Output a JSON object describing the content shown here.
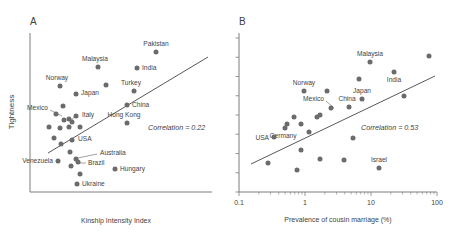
{
  "figure": {
    "background_color": "#ffffff",
    "dot_color": "#6b6b6b",
    "line_color": "#595959",
    "axis_color": "#7d7d7d",
    "text_color": "#3f3f3f"
  },
  "panels": [
    {
      "letter": "A",
      "ylabel": "Tightness",
      "xlabel": "Kinship Intensity Index",
      "correlation_text": "Correlation = 0.22"
    },
    {
      "letter": "B",
      "ylabel": "",
      "xlabel": "Prevalence of cousin marriage (%)",
      "correlation_text": "Correlation = 0.53",
      "xticks": [
        "0.1",
        "1",
        "10",
        "100"
      ]
    }
  ],
  "chart_data": [
    {
      "type": "scatter",
      "title": "A",
      "xlabel": "Kinship Intensity Index",
      "ylabel": "Tightness",
      "correlation": 0.22,
      "annotation": "Correlation = 0.22",
      "xaxis_scale": "linear",
      "xaxis_ticks": [],
      "yaxis_ticks": [],
      "grid": false,
      "trend_line": {
        "x1": 48,
        "y1": 153,
        "x2": 208,
        "y2": 57
      },
      "points": [
        {
          "label": "Malaysia",
          "x": 98,
          "y": 67,
          "label_dx": -3,
          "label_dy": -6,
          "anchor": "middle"
        },
        {
          "label": "Pakistan",
          "x": 156,
          "y": 52,
          "label_dx": 0,
          "label_dy": -6,
          "anchor": "middle"
        },
        {
          "label": "India",
          "x": 137,
          "y": 68,
          "label_dx": 5,
          "label_dy": 2,
          "anchor": "start"
        },
        {
          "label": "Norway",
          "x": 60,
          "y": 86,
          "label_dx": -3,
          "label_dy": -6,
          "anchor": "middle"
        },
        {
          "label": "Turkey",
          "x": 134,
          "y": 91,
          "label_dx": -3,
          "label_dy": -6,
          "anchor": "middle"
        },
        {
          "label": "Japan",
          "x": 76,
          "y": 94,
          "label_dx": 5,
          "label_dy": 1,
          "anchor": "start"
        },
        {
          "label": "China",
          "x": 127,
          "y": 105,
          "label_dx": 5,
          "label_dy": 2,
          "anchor": "start"
        },
        {
          "label": "Italy",
          "x": 76,
          "y": 116,
          "label_dx": 6,
          "label_dy": 1,
          "anchor": "start"
        },
        {
          "label": "Hong Kong",
          "x": 127,
          "y": 123,
          "label_dx": -3,
          "label_dy": -6,
          "anchor": "middle"
        },
        {
          "label": "USA",
          "x": 72,
          "y": 140,
          "label_dx": 6,
          "label_dy": 1,
          "anchor": "start"
        },
        {
          "label": "Venezuela",
          "x": 58,
          "y": 161,
          "label_dx": -5,
          "label_dy": 2,
          "anchor": "end"
        },
        {
          "label": "Hungary",
          "x": 115,
          "y": 169,
          "label_dx": 5,
          "label_dy": 2,
          "anchor": "start"
        },
        {
          "label": "Ukraine",
          "x": 77,
          "y": 184,
          "label_dx": 5,
          "label_dy": 2,
          "anchor": "start"
        },
        {
          "label": "",
          "x": 106,
          "y": 85,
          "label_dx": 0,
          "label_dy": 0,
          "anchor": "middle"
        },
        {
          "label": "",
          "x": 63,
          "y": 106,
          "label_dx": 0,
          "label_dy": 0,
          "anchor": "middle"
        },
        {
          "label": "",
          "x": 56,
          "y": 114,
          "label_dx": 0,
          "label_dy": 0,
          "anchor": "middle"
        },
        {
          "label": "",
          "x": 64,
          "y": 120,
          "label_dx": 0,
          "label_dy": 0,
          "anchor": "middle"
        },
        {
          "label": "",
          "x": 69,
          "y": 119,
          "label_dx": 0,
          "label_dy": 0,
          "anchor": "middle"
        },
        {
          "label": "",
          "x": 72,
          "y": 122,
          "label_dx": 0,
          "label_dy": 0,
          "anchor": "middle"
        },
        {
          "label": "",
          "x": 69,
          "y": 127,
          "label_dx": 0,
          "label_dy": 0,
          "anchor": "middle"
        },
        {
          "label": "",
          "x": 49,
          "y": 127,
          "label_dx": 0,
          "label_dy": 0,
          "anchor": "middle"
        },
        {
          "label": "",
          "x": 60,
          "y": 128,
          "label_dx": 0,
          "label_dy": 0,
          "anchor": "middle"
        },
        {
          "label": "",
          "x": 80,
          "y": 127,
          "label_dx": 0,
          "label_dy": 0,
          "anchor": "middle"
        },
        {
          "label": "",
          "x": 54,
          "y": 138,
          "label_dx": 0,
          "label_dy": 0,
          "anchor": "middle"
        },
        {
          "label": "",
          "x": 61,
          "y": 144,
          "label_dx": 0,
          "label_dy": 0,
          "anchor": "middle"
        },
        {
          "label": "",
          "x": 70,
          "y": 152,
          "label_dx": 0,
          "label_dy": 0,
          "anchor": "middle"
        },
        {
          "label": "",
          "x": 76,
          "y": 159,
          "label_dx": 0,
          "label_dy": 0,
          "anchor": "middle"
        },
        {
          "label": "",
          "x": 78,
          "y": 162,
          "label_dx": 0,
          "label_dy": 0,
          "anchor": "middle"
        },
        {
          "label": "",
          "x": 71,
          "y": 166,
          "label_dx": 0,
          "label_dy": 0,
          "anchor": "middle"
        },
        {
          "label": "",
          "x": 80,
          "y": 174,
          "label_dx": 0,
          "label_dy": 0,
          "anchor": "middle"
        }
      ],
      "leader_lines": [
        {
          "name": "mexico-leader",
          "x1": 50,
          "y1": 110,
          "x2": 62,
          "y2": 116
        },
        {
          "name": "italy-leader",
          "x1": 75,
          "y1": 116,
          "x2": 70,
          "y2": 122
        },
        {
          "name": "australia-leader",
          "x1": 97,
          "y1": 154,
          "x2": 78,
          "y2": 158
        },
        {
          "name": "brazil-leader",
          "x1": 86,
          "y1": 163,
          "x2": 79,
          "y2": 163
        }
      ],
      "callout_labels": [
        {
          "text": "Mexico",
          "x": 48,
          "y": 110,
          "anchor": "end"
        },
        {
          "text": "Australia",
          "x": 100,
          "y": 155,
          "anchor": "start"
        },
        {
          "text": "Brazil",
          "x": 88,
          "y": 165,
          "anchor": "start"
        }
      ]
    },
    {
      "type": "scatter",
      "title": "B",
      "xlabel": "Prevalence of cousin marriage (%)",
      "ylabel": "",
      "correlation": 0.53,
      "annotation": "Correlation = 0.53",
      "xaxis_scale": "log",
      "xaxis_ticks": [
        "0.1",
        "1",
        "10",
        "100"
      ],
      "xlim": [
        0.1,
        100
      ],
      "grid": false,
      "trend_line": {
        "x1": 12,
        "y1": 164,
        "x2": 196,
        "y2": 76
      },
      "points": [
        {
          "label": "Malaysia",
          "x": 131,
          "y": 62,
          "label_dx": 0,
          "label_dy": -6,
          "anchor": "middle"
        },
        {
          "label": "",
          "x": 190,
          "y": 56,
          "label_dx": 0,
          "label_dy": 0,
          "anchor": "middle"
        },
        {
          "label": "India",
          "x": 155,
          "y": 72,
          "label_dx": 0,
          "label_dy": 10,
          "anchor": "middle"
        },
        {
          "label": "",
          "x": 120,
          "y": 79,
          "label_dx": 0,
          "label_dy": 0,
          "anchor": "middle"
        },
        {
          "label": "Norway",
          "x": 65,
          "y": 91,
          "label_dx": 0,
          "label_dy": -6,
          "anchor": "middle"
        },
        {
          "label": "",
          "x": 88,
          "y": 91,
          "label_dx": 0,
          "label_dy": 0,
          "anchor": "middle"
        },
        {
          "label": "Japan",
          "x": 123,
          "y": 99,
          "label_dx": 0,
          "label_dy": -6,
          "anchor": "middle"
        },
        {
          "label": "",
          "x": 165,
          "y": 96,
          "label_dx": 0,
          "label_dy": 0,
          "anchor": "middle"
        },
        {
          "label": "China",
          "x": 110,
          "y": 107,
          "label_dx": -2,
          "label_dy": -6,
          "anchor": "middle"
        },
        {
          "label": "",
          "x": 92,
          "y": 108,
          "label_dx": 0,
          "label_dy": 0,
          "anchor": "middle"
        },
        {
          "label": "",
          "x": 81,
          "y": 115,
          "label_dx": 0,
          "label_dy": 0,
          "anchor": "middle"
        },
        {
          "label": "",
          "x": 78,
          "y": 117,
          "label_dx": 0,
          "label_dy": 0,
          "anchor": "middle"
        },
        {
          "label": "",
          "x": 55,
          "y": 117,
          "label_dx": 0,
          "label_dy": 0,
          "anchor": "middle"
        },
        {
          "label": "",
          "x": 62,
          "y": 124,
          "label_dx": 0,
          "label_dy": 0,
          "anchor": "middle"
        },
        {
          "label": "",
          "x": 48,
          "y": 124,
          "label_dx": 0,
          "label_dy": 0,
          "anchor": "middle"
        },
        {
          "label": "Germany",
          "x": 46,
          "y": 128,
          "label_dx": -2,
          "label_dy": 10,
          "anchor": "middle"
        },
        {
          "label": "",
          "x": 70,
          "y": 132,
          "label_dx": 0,
          "label_dy": 0,
          "anchor": "middle"
        },
        {
          "label": "",
          "x": 114,
          "y": 138,
          "label_dx": 0,
          "label_dy": 0,
          "anchor": "middle"
        },
        {
          "label": "USA",
          "x": 35,
          "y": 137,
          "label_dx": -5,
          "label_dy": 3,
          "anchor": "end"
        },
        {
          "label": "",
          "x": 62,
          "y": 150,
          "label_dx": 0,
          "label_dy": 0,
          "anchor": "middle"
        },
        {
          "label": "",
          "x": 81,
          "y": 159,
          "label_dx": 0,
          "label_dy": 0,
          "anchor": "middle"
        },
        {
          "label": "",
          "x": 105,
          "y": 160,
          "label_dx": 0,
          "label_dy": 0,
          "anchor": "middle"
        },
        {
          "label": "Israel",
          "x": 140,
          "y": 168,
          "label_dx": 0,
          "label_dy": -6,
          "anchor": "middle"
        },
        {
          "label": "",
          "x": 29,
          "y": 163,
          "label_dx": 0,
          "label_dy": 0,
          "anchor": "middle"
        },
        {
          "label": "",
          "x": 58,
          "y": 170,
          "label_dx": 0,
          "label_dy": 0,
          "anchor": "middle"
        }
      ],
      "leader_lines": [
        {
          "name": "mexico-leader",
          "x1": 87,
          "y1": 101,
          "x2": 95,
          "y2": 108
        }
      ],
      "callout_labels": [
        {
          "text": "Mexico",
          "x": 85,
          "y": 101,
          "anchor": "end"
        }
      ]
    }
  ]
}
